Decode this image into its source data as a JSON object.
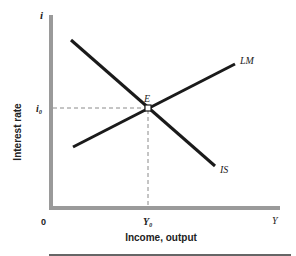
{
  "diagram": {
    "y_axis": {
      "symbol": "i",
      "label": "Interest rate",
      "tick_label": "i₀"
    },
    "x_axis": {
      "origin": "0",
      "symbol": "Y",
      "label": "Income, output",
      "tick_label": "Y₀"
    },
    "curves": [
      {
        "name": "LM",
        "label": "LM",
        "slope": "upward"
      },
      {
        "name": "IS",
        "label": "IS",
        "slope": "downward"
      }
    ],
    "equilibrium": {
      "label": "E",
      "interest_rate": "i₀",
      "income": "Y₀"
    },
    "colors": {
      "axis": "#9a9a9a",
      "curve": "#1a1a1a",
      "dashed": "#8a8a8a",
      "text": "#222222"
    }
  }
}
